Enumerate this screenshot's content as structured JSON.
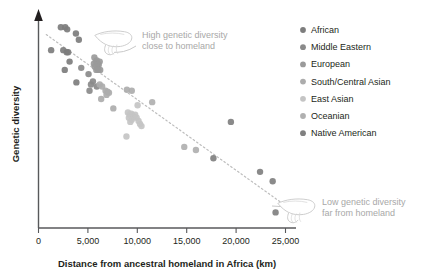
{
  "figure": {
    "background": "#ffffff"
  },
  "axes": {
    "x": {
      "title": "Distance from ancestral homeland in Africa (km)",
      "ticks": [
        "0",
        "5,000",
        "10,000",
        "15,000",
        "20,000",
        "25,000"
      ],
      "tick_values": [
        0,
        5000,
        10000,
        15000,
        20000,
        25000
      ],
      "min": 0,
      "max": 26500
    },
    "y": {
      "title": "Genetic diversity",
      "ticks": [],
      "min": 0,
      "max": 1
    },
    "axis_color": "#58595b"
  },
  "legend": {
    "position": "right",
    "items": [
      {
        "label": "African",
        "color": "#7d7d7d"
      },
      {
        "label": "Middle Eastern",
        "color": "#8a8a8a"
      },
      {
        "label": "European",
        "color": "#9a9a9a"
      },
      {
        "label": "South/Central Asian",
        "color": "#acacac"
      },
      {
        "label": "East Asian",
        "color": "#c4c4c4"
      },
      {
        "label": "Oceanian",
        "color": "#b0b0b0"
      },
      {
        "label": "Native American",
        "color": "#808080"
      }
    ]
  },
  "annotations": [
    {
      "id": "high-diversity",
      "icon": "pointing-hand-icon",
      "line1": "High genetic diversity",
      "line2": "close to homeland",
      "color": "#a8a8a8"
    },
    {
      "id": "low-diversity",
      "icon": "pointing-hand-icon",
      "line1": "Low genetic diversity",
      "line2": "far from homeland",
      "color": "#a8a8a8"
    }
  ],
  "trendline": {
    "style": "dotted",
    "color": "#bdbdbd",
    "x1": 800,
    "y1": 0.93,
    "x2": 25200,
    "y2": 0.115
  },
  "chart_data": {
    "type": "scatter",
    "title": "",
    "xlabel": "Distance from ancestral homeland in Africa (km)",
    "ylabel": "Genetic diversity",
    "xlim": [
      0,
      26500
    ],
    "ylim": [
      0,
      1
    ],
    "grid": false,
    "legend_position": "right",
    "series": [
      {
        "name": "African",
        "color": "#7d7d7d",
        "points": [
          [
            1300,
            0.855
          ],
          [
            2300,
            0.965
          ],
          [
            2750,
            0.965
          ],
          [
            2950,
            0.955
          ],
          [
            2550,
            0.855
          ],
          [
            2900,
            0.845
          ],
          [
            3050,
            0.845
          ],
          [
            2700,
            0.76
          ],
          [
            3850,
            0.935
          ],
          [
            3200,
            0.8
          ],
          [
            3900,
            0.7
          ],
          [
            4150,
            0.905
          ]
        ]
      },
      {
        "name": "Middle Eastern",
        "color": "#8a8a8a",
        "points": [
          [
            4400,
            0.77
          ],
          [
            5150,
            0.74
          ],
          [
            5400,
            0.69
          ],
          [
            5600,
            0.705
          ],
          [
            5250,
            0.66
          ],
          [
            6000,
            0.68
          ]
        ]
      },
      {
        "name": "European",
        "color": "#9a9a9a",
        "points": [
          [
            5750,
            0.82
          ],
          [
            5900,
            0.8
          ],
          [
            6000,
            0.805
          ],
          [
            6100,
            0.79
          ],
          [
            5800,
            0.775
          ],
          [
            6050,
            0.77
          ],
          [
            6200,
            0.785
          ],
          [
            5950,
            0.76
          ],
          [
            6300,
            0.8
          ],
          [
            6150,
            0.76
          ],
          [
            5700,
            0.79
          ],
          [
            6350,
            0.76
          ]
        ]
      },
      {
        "name": "South/Central Asian",
        "color": "#acacac",
        "points": [
          [
            6550,
            0.68
          ],
          [
            6900,
            0.66
          ],
          [
            7100,
            0.655
          ],
          [
            6450,
            0.62
          ],
          [
            7000,
            0.64
          ],
          [
            6300,
            0.69
          ],
          [
            7250,
            0.65
          ],
          [
            7700,
            0.575
          ],
          [
            9100,
            0.665
          ],
          [
            9600,
            0.66
          ]
        ]
      },
      {
        "name": "East Asian",
        "color": "#c4c4c4",
        "points": [
          [
            9200,
            0.555
          ],
          [
            9400,
            0.545
          ],
          [
            9550,
            0.55
          ],
          [
            9700,
            0.54
          ],
          [
            9300,
            0.53
          ],
          [
            9800,
            0.535
          ],
          [
            9950,
            0.545
          ],
          [
            9600,
            0.52
          ],
          [
            10100,
            0.53
          ],
          [
            10300,
            0.515
          ],
          [
            9450,
            0.51
          ],
          [
            10450,
            0.5
          ],
          [
            10200,
            0.59
          ],
          [
            10600,
            0.49
          ],
          [
            9050,
            0.44
          ]
        ]
      },
      {
        "name": "Oceanian",
        "color": "#b0b0b0",
        "points": [
          [
            11700,
            0.605
          ],
          [
            15000,
            0.39
          ],
          [
            16200,
            0.375
          ]
        ]
      },
      {
        "name": "Native American",
        "color": "#808080",
        "points": [
          [
            18000,
            0.335
          ],
          [
            19800,
            0.51
          ],
          [
            22800,
            0.27
          ],
          [
            24100,
            0.225
          ],
          [
            24400,
            0.075
          ]
        ]
      }
    ]
  }
}
